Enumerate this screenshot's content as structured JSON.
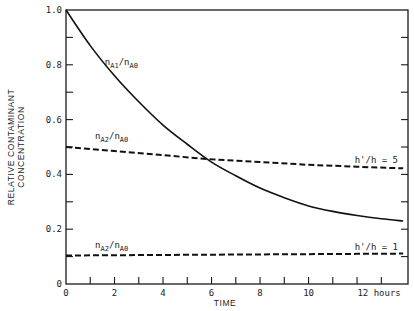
{
  "chart_data": {
    "type": "line",
    "title": "",
    "xlabel": "TIME",
    "ylabel": "RELATIVE CONTAMINANT CONCENTRATION",
    "ylabel_lines": [
      "RELATIVE CONTAMINANT",
      "CONCENTRATION"
    ],
    "xlim": [
      0,
      14.1
    ],
    "ylim": [
      0,
      1.0
    ],
    "x_ticks": [
      0,
      1,
      2,
      3,
      4,
      5,
      6,
      7,
      8,
      9,
      10,
      11,
      12,
      13
    ],
    "x_tick_labels": [
      "0",
      "2",
      "4",
      "6",
      "8",
      "10",
      "12 hours"
    ],
    "x_tick_label_values": [
      0,
      2,
      4,
      6,
      8,
      10,
      12
    ],
    "y_ticks": [
      0,
      0.1,
      0.2,
      0.3,
      0.4,
      0.5,
      0.6,
      0.7,
      0.8,
      0.9,
      1.0
    ],
    "y_tick_labels": [
      "0",
      "0.2",
      "0.4",
      "0.6",
      "0.8",
      "1.0"
    ],
    "y_tick_label_values": [
      0,
      0.2,
      0.4,
      0.6,
      0.8,
      1.0
    ],
    "grid": false,
    "legend": "none (inline annotations)",
    "series": [
      {
        "name": "nA1/nA0",
        "style": "solid",
        "x": [
          0,
          1,
          2,
          3,
          4,
          5,
          6,
          7,
          8,
          9,
          10,
          11,
          12,
          13,
          13.9
        ],
        "values": [
          1.0,
          0.87,
          0.76,
          0.665,
          0.58,
          0.51,
          0.445,
          0.395,
          0.35,
          0.315,
          0.285,
          0.265,
          0.25,
          0.238,
          0.23
        ]
      },
      {
        "name": "nA2/nA0 (h'/h = 5)",
        "style": "dashed",
        "x": [
          0,
          2,
          4,
          6,
          8,
          10,
          12,
          13.9
        ],
        "values": [
          0.5,
          0.485,
          0.47,
          0.455,
          0.445,
          0.435,
          0.428,
          0.422
        ]
      },
      {
        "name": "nA2/nA0 (h'/h = 1)",
        "style": "dashed",
        "x": [
          0,
          2,
          4,
          6,
          8,
          10,
          12,
          13.9
        ],
        "values": [
          0.104,
          0.105,
          0.106,
          0.107,
          0.108,
          0.109,
          0.11,
          0.111
        ]
      }
    ],
    "annotations": [
      {
        "text": "nA1/nA0",
        "main": "n",
        "sub1": "A1",
        "slash": "/",
        "main2": "n",
        "sub2": "A0",
        "x": 1.6,
        "y": 0.8
      },
      {
        "text": "nA2/nA0",
        "main": "n",
        "sub1": "A2",
        "slash": "/",
        "main2": "n",
        "sub2": "A0",
        "x": 1.2,
        "y": 0.53
      },
      {
        "text": "h'/h = 5",
        "x": 11.9,
        "y": 0.44
      },
      {
        "text": "nA2/nA0",
        "main": "n",
        "sub1": "A2",
        "slash": "/",
        "main2": "n",
        "sub2": "A0",
        "x": 1.2,
        "y": 0.13
      },
      {
        "text": "h'/h = 1",
        "x": 11.9,
        "y": 0.125
      }
    ]
  }
}
